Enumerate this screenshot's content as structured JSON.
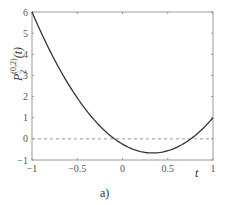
{
  "chart_data": {
    "type": "line",
    "title": "",
    "caption": "a)",
    "xlabel": "t",
    "ylabel": "P_2^{(0,2)}(t)",
    "ylabel_base": "P",
    "ylabel_sub": "2",
    "ylabel_sup": "(0,2)",
    "ylabel_arg": "(t)",
    "xlim": [
      -1,
      1
    ],
    "ylim": [
      -1,
      6
    ],
    "xticks": [
      -1,
      -0.5,
      0,
      0.5,
      1
    ],
    "xtick_labels": [
      "−1",
      "−0.5",
      "0",
      "0.5",
      "1"
    ],
    "yticks": [
      -1,
      0,
      1,
      2,
      3,
      4,
      5,
      6
    ],
    "ytick_labels": [
      "−1",
      "0",
      "1",
      "2",
      "3",
      "4",
      "5",
      "6"
    ],
    "grid": false,
    "reference_line": {
      "y": 0,
      "style": "dashed"
    },
    "series": [
      {
        "name": "P_2^{(0,2)}(t)",
        "formula": "(15t^2 - 10t - 1)/4",
        "x": [
          -1,
          -0.75,
          -0.5,
          -0.25,
          0,
          0.25,
          0.333,
          0.5,
          0.75,
          1
        ],
        "y": [
          6,
          3.73,
          1.94,
          0.61,
          -0.25,
          -0.64,
          -0.67,
          -0.56,
          0.23,
          1
        ]
      }
    ]
  },
  "colors": {
    "curve": "#333333",
    "axes": "#9a9a9a",
    "zero_line": "#9a9a9a"
  }
}
